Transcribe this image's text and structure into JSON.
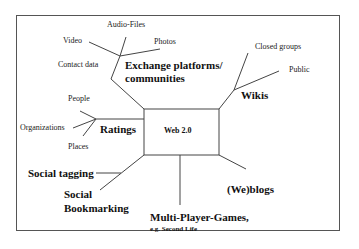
{
  "diagram": {
    "center": {
      "label": "Web 2.0"
    },
    "branches": [
      {
        "id": "exchange",
        "label_line1": "Exchange platforms/",
        "label_line2": "communities",
        "children": [
          "Video",
          "Audio-Files",
          "Photos",
          "Contact data"
        ]
      },
      {
        "id": "wikis",
        "label": "Wikis",
        "children": [
          "Closed groups",
          "Public"
        ]
      },
      {
        "id": "ratings",
        "label": "Ratings",
        "children": [
          "People",
          "Organizations",
          "Places"
        ]
      },
      {
        "id": "social-tagging",
        "label": "Social tagging"
      },
      {
        "id": "social-bookmarking",
        "label_line1": "Social",
        "label_line2": "Bookmarking"
      },
      {
        "id": "games",
        "label": "Multi-Player-Games,",
        "sublabel": "e.g. Second Life"
      },
      {
        "id": "weblogs",
        "label": "(We)blogs"
      }
    ]
  },
  "colors": {
    "line": "#444444",
    "frame": "#555555",
    "text": "#111111"
  }
}
